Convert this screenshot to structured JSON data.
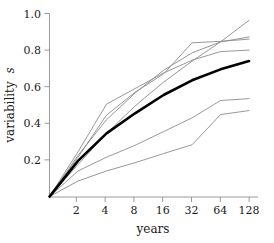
{
  "chart_data": {
    "type": "line",
    "title": "",
    "xlabel": "years",
    "ylabel": "variability s",
    "ylabel_main": "variability",
    "ylabel_symbol": "s",
    "xscale": "log2",
    "xlim": [
      1,
      128
    ],
    "ylim": [
      0.0,
      1.0
    ],
    "grid": false,
    "legend": "none",
    "x_tick_labels": [
      "2",
      "4",
      "8",
      "16",
      "32",
      "64",
      "128"
    ],
    "x_tick_values": [
      2,
      4,
      8,
      16,
      32,
      64,
      128
    ],
    "y_tick_labels": [
      "0.2",
      "0.4",
      "0.6",
      "0.8",
      "1.0"
    ],
    "y_tick_values": [
      0.2,
      0.4,
      0.6,
      0.8,
      1.0
    ],
    "x": [
      1,
      2,
      4,
      8,
      16,
      32,
      64,
      128
    ],
    "series": [
      {
        "name": "mean",
        "style": "thick-black",
        "color": "#000000",
        "width": 2.6,
        "values": [
          0.0,
          0.195,
          0.345,
          0.455,
          0.555,
          0.635,
          0.695,
          0.74
        ]
      },
      {
        "name": "upper-1",
        "style": "thin-grey",
        "color": "#8c8c8c",
        "width": 0.9,
        "values": [
          0.0,
          0.175,
          0.345,
          0.495,
          0.625,
          0.74,
          0.845,
          0.963
        ]
      },
      {
        "name": "upper-2",
        "style": "thin-grey",
        "color": "#8c8c8c",
        "width": 0.9,
        "values": [
          0.0,
          0.225,
          0.42,
          0.565,
          0.69,
          0.785,
          0.845,
          0.872
        ]
      },
      {
        "name": "upper-3",
        "style": "thin-grey",
        "color": "#8c8c8c",
        "width": 0.9,
        "values": [
          0.0,
          0.215,
          0.445,
          0.57,
          0.67,
          0.84,
          0.848,
          0.86
        ]
      },
      {
        "name": "upper-4",
        "style": "thin-grey",
        "color": "#8c8c8c",
        "width": 0.9,
        "values": [
          0.0,
          0.245,
          0.505,
          0.59,
          0.675,
          0.745,
          0.792,
          0.8
        ]
      },
      {
        "name": "lower-1",
        "style": "thin-grey",
        "color": "#8c8c8c",
        "width": 0.9,
        "values": [
          0.0,
          0.14,
          0.215,
          0.28,
          0.355,
          0.43,
          0.525,
          0.535
        ]
      },
      {
        "name": "lower-2",
        "style": "thin-grey",
        "color": "#8c8c8c",
        "width": 0.9,
        "values": [
          0.0,
          0.085,
          0.14,
          0.185,
          0.235,
          0.283,
          0.448,
          0.47
        ]
      }
    ],
    "axis_color": "#9a9a9a",
    "background": "#ffffff"
  }
}
